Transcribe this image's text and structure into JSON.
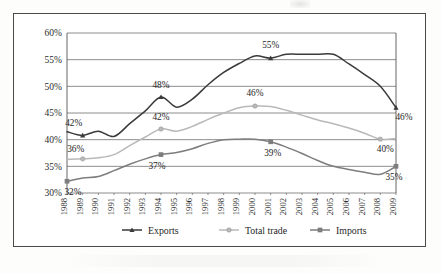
{
  "chart_data": {
    "type": "line",
    "title": "",
    "xlabel": "",
    "ylabel": "",
    "ylim": [
      30,
      60
    ],
    "ytick_labels": [
      "30%",
      "35%",
      "40%",
      "45%",
      "50%",
      "55%",
      "60%"
    ],
    "ytick_values": [
      30,
      35,
      40,
      45,
      50,
      55,
      60
    ],
    "grid": true,
    "legend_position": "bottom",
    "value_suffix": "%",
    "categories": [
      "1988",
      "1989",
      "1990",
      "1991",
      "1992",
      "1993",
      "1994",
      "1995",
      "1996",
      "1997",
      "1998",
      "1999",
      "2000",
      "2001",
      "2002",
      "2003",
      "2004",
      "2005",
      "2006",
      "2007",
      "2008",
      "2009"
    ],
    "series": [
      {
        "name": "Exports",
        "color": "#3a3a3a",
        "marker": "triangle",
        "values": [
          41.5,
          40.8,
          41.6,
          40.6,
          43.0,
          45.4,
          48.0,
          46.1,
          47.6,
          50.3,
          52.6,
          54.3,
          55.7,
          55.3,
          56.0,
          56.0,
          56.0,
          56.0,
          54.2,
          52.2,
          50.0,
          46.0
        ],
        "labels": [
          {
            "category": "1989",
            "value": 42,
            "text": "42%"
          },
          {
            "category": "1994",
            "value": 48,
            "text": "48%"
          },
          {
            "category": "2001",
            "value": 55,
            "text": "55%"
          },
          {
            "category": "2009",
            "value": 46,
            "text": "46%"
          }
        ]
      },
      {
        "name": "Total trade",
        "color": "#b9b9b9",
        "marker": "circle",
        "values": [
          36.3,
          36.4,
          36.6,
          37.2,
          38.9,
          40.5,
          42.0,
          41.6,
          42.5,
          43.8,
          45.0,
          46.0,
          46.3,
          46.2,
          45.5,
          44.6,
          43.7,
          43.0,
          42.2,
          41.2,
          40.1,
          40.2
        ],
        "labels": [
          {
            "category": "1989",
            "value": 36,
            "text": "36%"
          },
          {
            "category": "1994",
            "value": 42,
            "text": "42%"
          },
          {
            "category": "2000",
            "value": 46,
            "text": "46%"
          },
          {
            "category": "2008",
            "value": 40,
            "text": "40%"
          }
        ]
      },
      {
        "name": "Imports",
        "color": "#7d7d7d",
        "marker": "square",
        "values": [
          32.2,
          32.8,
          33.1,
          34.2,
          35.4,
          36.4,
          37.2,
          37.6,
          38.3,
          39.3,
          40.0,
          40.1,
          40.1,
          39.6,
          38.6,
          37.4,
          36.1,
          35.0,
          34.4,
          33.9,
          33.5,
          35.0
        ],
        "labels": [
          {
            "category": "1988",
            "value": 32,
            "text": "32%"
          },
          {
            "category": "1994",
            "value": 37,
            "text": "37%"
          },
          {
            "category": "2001",
            "value": 39,
            "text": "39%"
          },
          {
            "category": "2009",
            "value": 35,
            "text": "35%"
          }
        ]
      }
    ]
  },
  "legend": {
    "items": [
      {
        "label": "Exports",
        "color": "#3a3a3a",
        "marker": "triangle"
      },
      {
        "label": "Total trade",
        "color": "#b9b9b9",
        "marker": "circle"
      },
      {
        "label": "Imports",
        "color": "#7d7d7d",
        "marker": "square"
      }
    ]
  }
}
